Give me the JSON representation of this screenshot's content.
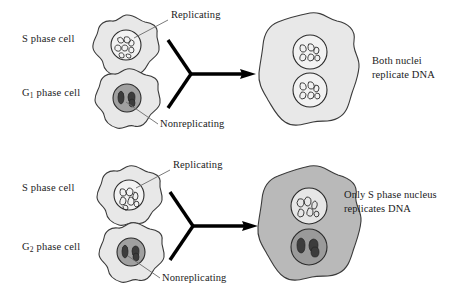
{
  "figure": {
    "background_color": "#ffffff",
    "width": 463,
    "height": 296
  },
  "colors": {
    "cell_light_fill": "#e8e8e8",
    "cell_medium_fill": "#b9b9b9",
    "outline": "#3a3a3a",
    "nucleus_light_fill": "#f2f2f2",
    "nucleus_dark_fill": "#a0a0a0",
    "chromatin_stroke": "#2b2b2b",
    "chromosome_dark_fill": "#4a4a4a",
    "arrow_color": "#000000",
    "leader_line_color": "#6b6b6b",
    "text_color": "#1b1b1b"
  },
  "panels": [
    {
      "id": "s-plus-g1",
      "parent_cells": [
        {
          "id": "s-phase-cell-top",
          "label": "S phase cell",
          "label_has_subscript": false,
          "subscript": "",
          "cell_shade": "light",
          "nucleus_state": "replicating",
          "callout": {
            "text": "Replicating",
            "target": "nucleus"
          }
        },
        {
          "id": "g1-phase-cell",
          "label_prefix": "G",
          "subscript": "1",
          "label_suffix": " phase cell",
          "label": "G1 phase cell",
          "label_has_subscript": true,
          "cell_shade": "light",
          "nucleus_state": "nonreplicating",
          "callout": {
            "text": "Nonreplicating",
            "target": "nucleus"
          }
        }
      ],
      "fusion_arrow": {
        "shape": "y-converging-arrow",
        "direction": "right"
      },
      "result_cell": {
        "id": "fused-cell-top",
        "cell_shade": "light",
        "nuclei": [
          {
            "state": "replicating"
          },
          {
            "state": "replicating"
          }
        ]
      },
      "result_text_lines": [
        "Both nuclei",
        "replicate DNA"
      ]
    },
    {
      "id": "s-plus-g2",
      "parent_cells": [
        {
          "id": "s-phase-cell-bottom",
          "label": "S phase cell",
          "label_has_subscript": false,
          "subscript": "",
          "cell_shade": "light",
          "nucleus_state": "replicating",
          "callout": {
            "text": "Replicating",
            "target": "nucleus"
          }
        },
        {
          "id": "g2-phase-cell",
          "label_prefix": "G",
          "subscript": "2",
          "label_suffix": " phase cell",
          "label": "G2 phase cell",
          "label_has_subscript": true,
          "cell_shade": "light",
          "nucleus_state": "nonreplicating",
          "callout": {
            "text": "Nonreplicating",
            "target": "nucleus"
          }
        }
      ],
      "fusion_arrow": {
        "shape": "y-converging-arrow",
        "direction": "right"
      },
      "result_cell": {
        "id": "fused-cell-bottom",
        "cell_shade": "medium",
        "nuclei": [
          {
            "state": "replicating"
          },
          {
            "state": "nonreplicating"
          }
        ]
      },
      "result_text_lines": [
        "Only S phase nucleus",
        "replicates DNA"
      ]
    }
  ],
  "labels": {
    "s_phase_top": "S phase cell",
    "g1_phase": "phase cell",
    "g1_letter": "G",
    "g1_sub": "1",
    "s_phase_bottom": "S phase cell",
    "g2_phase": "phase cell",
    "g2_letter": "G",
    "g2_sub": "2",
    "replicating_top": "Replicating",
    "nonreplicating_top": "Nonreplicating",
    "replicating_bottom": "Replicating",
    "nonreplicating_bottom": "Nonreplicating",
    "result_top_line1": "Both nuclei",
    "result_top_line2": "replicate DNA",
    "result_bottom_line1": "Only S phase nucleus",
    "result_bottom_line2": "replicates DNA"
  }
}
